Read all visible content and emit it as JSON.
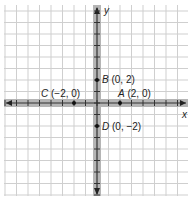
{
  "diagram": {
    "type": "coordinate-plane",
    "axes": {
      "x_label": "x",
      "y_label": "y"
    },
    "grid": {
      "x_range": [
        -8,
        8
      ],
      "y_range": [
        -8,
        8
      ],
      "unit_px": 11.5
    },
    "points": [
      {
        "name": "A",
        "coords": "(2, 0)",
        "x": 2,
        "y": 0
      },
      {
        "name": "B",
        "coords": "(0, 2)",
        "x": 0,
        "y": 2
      },
      {
        "name": "C",
        "coords": "(−2, 0)",
        "x": -2,
        "y": 0
      },
      {
        "name": "D",
        "coords": "(0, −2)",
        "x": 0,
        "y": -2
      }
    ],
    "colors": {
      "grid": "#cfcfcf",
      "axis": "#8a8a8a",
      "axis_core": "#333333",
      "point": "#111111"
    }
  }
}
